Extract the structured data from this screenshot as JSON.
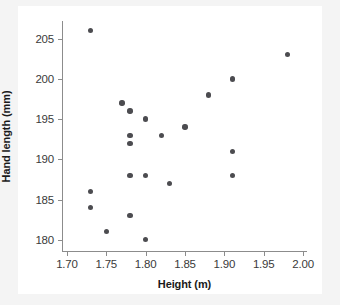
{
  "chart_data": {
    "type": "scatter",
    "title": "",
    "xlabel": "Height (m)",
    "ylabel": "Hand length (mm)",
    "xlim": [
      1.695,
      2.005
    ],
    "ylim": [
      178.6,
      207.2
    ],
    "xticks": [
      "1.70",
      "1.75",
      "1.80",
      "1.85",
      "1.90",
      "1.95",
      "2.00"
    ],
    "xtick_values": [
      1.7,
      1.75,
      1.8,
      1.85,
      1.9,
      1.95,
      2.0
    ],
    "yticks": [
      "180",
      "185",
      "190",
      "195",
      "200",
      "205"
    ],
    "ytick_values": [
      180,
      185,
      190,
      195,
      200,
      205
    ],
    "grid": false,
    "legend": false,
    "marker_color": "#4c4c50",
    "axis_color": "#8c8c8c",
    "background": "#f4f4f4",
    "plot_background": "#ffffff",
    "n_points": 21,
    "points": [
      {
        "x": 1.73,
        "y": 206
      },
      {
        "x": 1.98,
        "y": 203
      },
      {
        "x": 1.91,
        "y": 200
      },
      {
        "x": 1.88,
        "y": 198
      },
      {
        "x": 1.77,
        "y": 197
      },
      {
        "x": 1.78,
        "y": 196
      },
      {
        "x": 1.8,
        "y": 195
      },
      {
        "x": 1.85,
        "y": 194
      },
      {
        "x": 1.78,
        "y": 193
      },
      {
        "x": 1.82,
        "y": 193
      },
      {
        "x": 1.78,
        "y": 192
      },
      {
        "x": 1.91,
        "y": 191
      },
      {
        "x": 1.78,
        "y": 188
      },
      {
        "x": 1.8,
        "y": 188
      },
      {
        "x": 1.91,
        "y": 188
      },
      {
        "x": 1.83,
        "y": 187
      },
      {
        "x": 1.73,
        "y": 186
      },
      {
        "x": 1.73,
        "y": 184
      },
      {
        "x": 1.78,
        "y": 183
      },
      {
        "x": 1.75,
        "y": 181
      },
      {
        "x": 1.8,
        "y": 180
      }
    ]
  }
}
